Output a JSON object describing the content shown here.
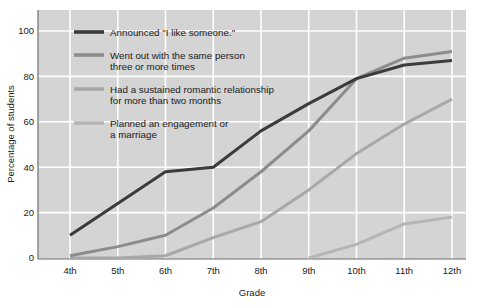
{
  "chart_data": {
    "type": "line",
    "title": "",
    "xlabel": "Grade",
    "ylabel": "Percentage of students",
    "categories": [
      "4th",
      "5th",
      "6th",
      "7th",
      "8th",
      "9th",
      "10th",
      "11th",
      "12th"
    ],
    "ylim": [
      0,
      100
    ],
    "yticks": [
      0,
      20,
      40,
      60,
      80,
      100
    ],
    "grid": true,
    "legend_position": "inside-top-left",
    "series": [
      {
        "name": "Announced \"I like someone.\"",
        "color": "#3b3b3b",
        "values": [
          10,
          24,
          38,
          40,
          56,
          68,
          79,
          85,
          87
        ]
      },
      {
        "name": "Went out with the same person three or more times",
        "color": "#8c8c8c",
        "values": [
          1,
          5,
          10,
          22,
          38,
          56,
          79,
          88,
          91
        ]
      },
      {
        "name": "Had a sustained romantic relationship for more than two months",
        "color": "#a8a8a8",
        "values": [
          0,
          0,
          1,
          9,
          16,
          30,
          46,
          59,
          70
        ]
      },
      {
        "name": "Planned an engagement or a marriage",
        "color": "#b5b5b5",
        "values": [
          null,
          null,
          null,
          null,
          null,
          0,
          6,
          15,
          18
        ]
      }
    ]
  },
  "axes": {
    "ylabel": "Percentage of students",
    "xlabel": "Grade",
    "ytick_labels": [
      "100",
      "80",
      "60",
      "40",
      "20",
      "0"
    ],
    "xtick_labels": [
      "4th",
      "5th",
      "6th",
      "7th",
      "8th",
      "9th",
      "10th",
      "11th",
      "12th"
    ]
  },
  "legend": {
    "entries": [
      {
        "line1": "Announced \"I like someone.\"",
        "line2": ""
      },
      {
        "line1": "Went out with the same person",
        "line2": "three or more times"
      },
      {
        "line1": "Had a sustained romantic relationship",
        "line2": "for more than two months"
      },
      {
        "line1": "Planned an engagement or",
        "line2": "a marriage"
      }
    ]
  },
  "colors": {
    "plot_background": "#d4d4d4",
    "page_background": "#ffffff",
    "gridline": "#ffffff",
    "axis_line": "#6e6e6e",
    "series_1": "#3b3b3b",
    "series_2": "#8c8c8c",
    "series_3": "#a8a8a8",
    "series_4": "#b5b5b5"
  }
}
